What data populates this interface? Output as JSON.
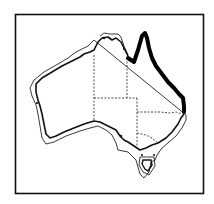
{
  "figure": {
    "highlighted_region": "Queensland east coast (Cape York to NSW border)",
    "colors": {
      "background": "#ffffff",
      "ink": "#111111",
      "highlight": "#000000"
    }
  }
}
